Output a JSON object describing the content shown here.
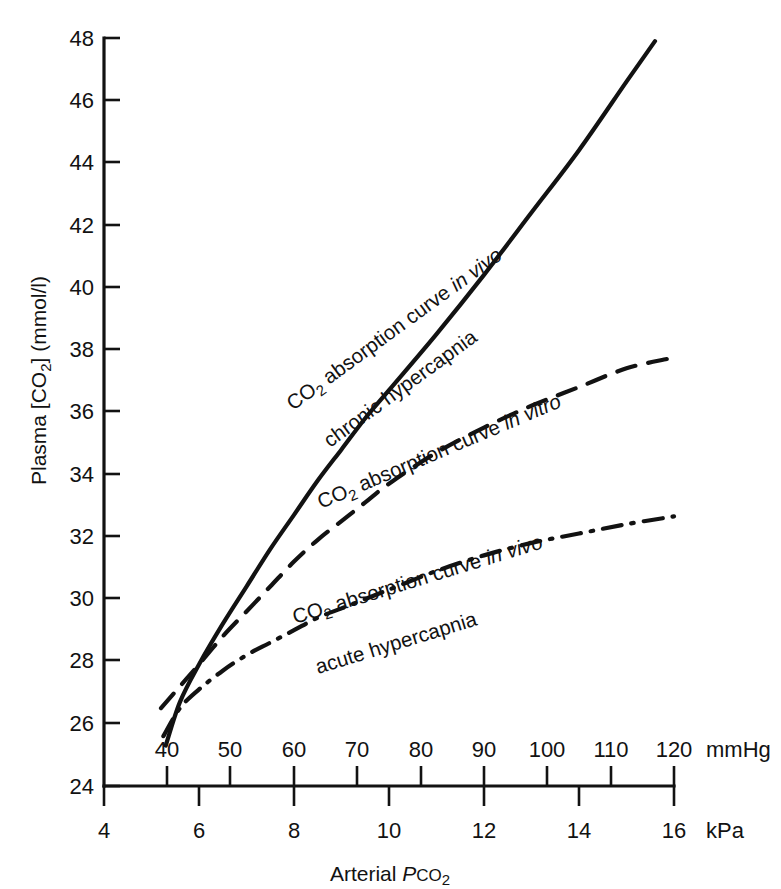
{
  "figure": {
    "background": "#ffffff",
    "ink": "#121212"
  },
  "chart_data": {
    "type": "line",
    "title": "",
    "xlabel": "Arterial PCO2",
    "ylabel": "Plasma [CO2] (mmol/l)",
    "x_unit_primary": "kPa",
    "x_unit_secondary": "mmHg",
    "grid": false,
    "legend_position": "inline-curve-labels",
    "xlim_kpa": [
      4,
      16
    ],
    "ylim": [
      24,
      48
    ],
    "x_ticks_kpa": [
      4,
      6,
      8,
      10,
      12,
      14,
      16
    ],
    "x_ticklabels_kpa": [
      "4",
      "6",
      "8",
      "10",
      "12",
      "14",
      "16"
    ],
    "x_ticks_mmhg": [
      40,
      50,
      60,
      70,
      80,
      90,
      100,
      110,
      120
    ],
    "x_ticklabels_mmhg": [
      "40",
      "50",
      "60",
      "70",
      "80",
      "90",
      "100",
      "110",
      "120"
    ],
    "y_ticks": [
      24,
      26,
      28,
      30,
      32,
      34,
      36,
      38,
      40,
      42,
      44,
      46,
      48
    ],
    "y_ticklabels": [
      "24",
      "26",
      "28",
      "30",
      "32",
      "34",
      "36",
      "38",
      "40",
      "42",
      "44",
      "46",
      "48"
    ],
    "series": [
      {
        "name": "CO2 absorption curve in vivo, chronic hypercapnia",
        "style": "solid",
        "x": [
          5.3,
          5.6,
          6.0,
          6.5,
          7.0,
          7.5,
          8.0,
          8.5,
          9.0,
          9.5,
          10.0,
          11.0,
          12.0,
          13.0,
          14.0,
          15.0,
          15.6
        ],
        "y": [
          25.3,
          26.7,
          27.9,
          29.2,
          30.4,
          31.6,
          32.7,
          33.8,
          34.8,
          35.8,
          36.7,
          38.5,
          40.4,
          42.4,
          44.4,
          46.6,
          47.9
        ]
      },
      {
        "name": "CO2 absorption curve in vitro",
        "style": "dashed",
        "x": [
          5.2,
          5.6,
          6.0,
          6.5,
          7.0,
          7.5,
          8.0,
          8.5,
          9.0,
          9.5,
          10.0,
          11.0,
          12.0,
          13.0,
          14.0,
          15.0,
          15.85
        ],
        "y": [
          26.5,
          27.2,
          27.9,
          28.8,
          29.6,
          30.4,
          31.2,
          31.9,
          32.5,
          33.1,
          33.7,
          34.7,
          35.5,
          36.2,
          36.8,
          37.4,
          37.7
        ]
      },
      {
        "name": "CO2 absorption curve in vivo, acute hypercapnia",
        "style": "dashdot",
        "x": [
          5.25,
          5.6,
          6.0,
          6.5,
          7.0,
          7.5,
          8.0,
          8.5,
          9.0,
          9.5,
          10.0,
          11.0,
          12.0,
          13.0,
          14.0,
          15.0,
          16.0
        ],
        "y": [
          25.6,
          26.5,
          27.1,
          27.7,
          28.2,
          28.6,
          29.0,
          29.4,
          29.7,
          30.0,
          30.3,
          30.9,
          31.4,
          31.8,
          32.1,
          32.4,
          32.65
        ]
      }
    ],
    "annotations": [
      {
        "id": "label-chronic",
        "line1": "CO2 absorption curve in vivo",
        "line2": "chronic hypercapnia",
        "line1_parts": [
          "CO",
          "2",
          " absorption curve ",
          "in vivo"
        ],
        "rotation": -36
      },
      {
        "id": "label-invitro",
        "line1": "CO2 absorption curve in vitro",
        "line1_parts": [
          "CO",
          "2",
          " absorption curve ",
          "in vitro"
        ],
        "rotation": -23
      },
      {
        "id": "label-acute",
        "line1": "CO2 absorption curve in vivo",
        "line2": "acute hypercapnia",
        "line1_parts": [
          "CO",
          "2",
          " absorption curve ",
          "in vivo"
        ],
        "rotation": -17
      }
    ]
  },
  "axes": {
    "y_title_parts": {
      "plasma": "Plasma [CO",
      "sub": "2",
      "close": "]  (mmol/l)"
    },
    "x_title_parts": {
      "arterial": "Arterial ",
      "p_italic": "P",
      "co": "CO",
      "sub": "2"
    },
    "unit_right_top": "mmHg",
    "unit_right_bottom": "kPa"
  },
  "labels": {
    "co": "CO",
    "sub2": "2",
    "absorption_curve": " absorption curve ",
    "in_vivo": "in vivo",
    "in_vitro": "in vitro",
    "chronic_hypercapnia": "chronic hypercapnia",
    "acute_hypercapnia": "acute hypercapnia"
  }
}
